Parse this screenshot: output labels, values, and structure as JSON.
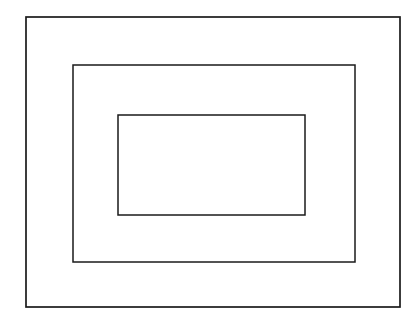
{
  "figure": {
    "type": "line-drawing",
    "canvas": {
      "width": 420,
      "height": 324,
      "background_color": "#ffffff"
    },
    "stroke_color": "#1a1a1a",
    "shapes": [
      {
        "name": "outer-rectangle",
        "label": "Outer rectangle",
        "x": 26,
        "y": 17,
        "width": 374,
        "height": 290,
        "stroke_width": 1.7,
        "fill": "none"
      },
      {
        "name": "middle-rectangle",
        "label": "Middle rectangle",
        "x": 73,
        "y": 65,
        "width": 282,
        "height": 197,
        "stroke_width": 1.5,
        "fill": "none"
      },
      {
        "name": "inner-rectangle",
        "label": "Inner rectangle",
        "x": 118,
        "y": 115,
        "width": 187,
        "height": 100,
        "stroke_width": 1.5,
        "fill": "none"
      }
    ]
  }
}
